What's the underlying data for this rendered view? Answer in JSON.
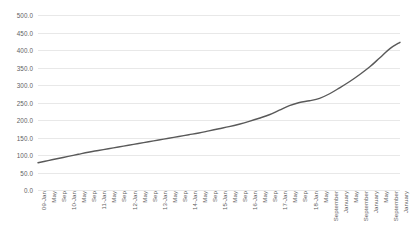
{
  "chart_data": {
    "type": "line",
    "title": "",
    "xlabel": "",
    "ylabel": "",
    "ylim": [
      0,
      500
    ],
    "y_ticks": [
      0,
      50,
      100,
      150,
      200,
      250,
      300,
      350,
      400,
      450,
      500
    ],
    "y_tick_labels": [
      "0.0",
      "50.0",
      "100.0",
      "150.0",
      "200.0",
      "250.0",
      "300.0",
      "350.0",
      "400.0",
      "450.0",
      "500.0"
    ],
    "grid": true,
    "legend": "none",
    "line_color": "#595959",
    "line_width": 1.4,
    "categories": [
      "09-Jan",
      "May",
      "Sep",
      "10-Jan",
      "May",
      "Sep",
      "11-Jan",
      "May",
      "Sep",
      "12-Jan",
      "May",
      "Sep",
      "13-Jan",
      "May",
      "Sep",
      "14-Jan",
      "May",
      "Sep",
      "15-Jan",
      "May",
      "Sep",
      "16-Jan",
      "May",
      "Sep",
      "17-Jan",
      "May",
      "Sep",
      "18-Jan",
      "May",
      "September",
      "January",
      "May",
      "September",
      "January",
      "May",
      "September",
      "January"
    ],
    "values": [
      78,
      84,
      90,
      96,
      102,
      108,
      113,
      118,
      123,
      128,
      133,
      138,
      143,
      148,
      153,
      158,
      163,
      169,
      175,
      181,
      188,
      196,
      205,
      215,
      228,
      241,
      250,
      255,
      262,
      275,
      292,
      310,
      330,
      352,
      378,
      404,
      422
    ]
  }
}
